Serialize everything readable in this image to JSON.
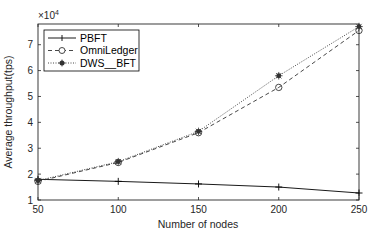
{
  "chart_data": {
    "type": "line",
    "title": "",
    "xlabel": "Number of nodes",
    "ylabel": "Average throughput(tps)",
    "y_exponent_label": "×10^4",
    "x": [
      50,
      100,
      150,
      200,
      250
    ],
    "xlim": [
      50,
      250
    ],
    "ylim": [
      1,
      7.8
    ],
    "xticks": [
      50,
      100,
      150,
      200,
      250
    ],
    "yticks": [
      1,
      2,
      3,
      4,
      5,
      6,
      7
    ],
    "y_scale_factor": 10000,
    "grid": false,
    "legend_position": "upper-left",
    "series": [
      {
        "name": "PBFT",
        "values": [
          1.8,
          1.72,
          1.62,
          1.5,
          1.27
        ],
        "style": "solid",
        "marker": "plus",
        "color": "#000000"
      },
      {
        "name": "OmniLedger",
        "values": [
          1.72,
          2.45,
          3.6,
          5.35,
          7.55
        ],
        "style": "dashed",
        "marker": "circle",
        "color": "#333333"
      },
      {
        "name": "DWS__BFT",
        "values": [
          1.75,
          2.48,
          3.65,
          5.8,
          7.7
        ],
        "style": "dotted",
        "marker": "asterisk",
        "color": "#333333"
      }
    ]
  },
  "labels": {
    "x_axis": "Number of nodes",
    "y_axis": "Average throughput(tps)",
    "exponent_base": "×10",
    "exponent_power": "4"
  },
  "legend": [
    {
      "label": "PBFT"
    },
    {
      "label": "OmniLedger"
    },
    {
      "label": "DWS__BFT"
    }
  ]
}
